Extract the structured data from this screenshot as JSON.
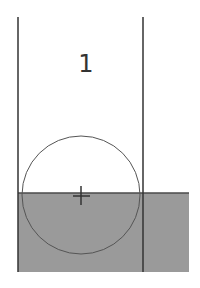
{
  "diagram": {
    "label": "1",
    "colors": {
      "lines": "#3a3a3a",
      "fill": "#9a9a9a",
      "background": "#ffffff"
    }
  }
}
